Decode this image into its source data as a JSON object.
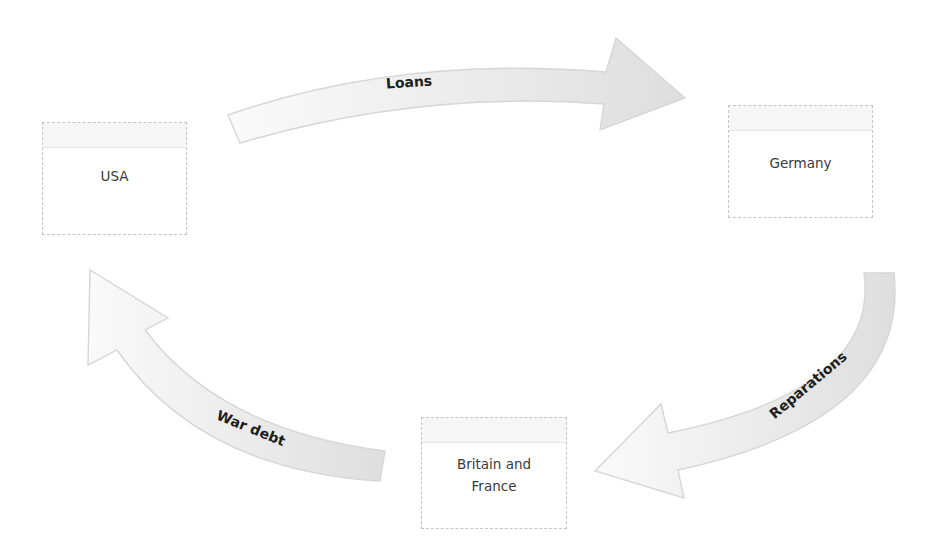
{
  "diagram": {
    "nodes": {
      "usa": {
        "label": "USA"
      },
      "germany": {
        "label": "Germany"
      },
      "britain_france": {
        "label_line1": "Britain and",
        "label_line2": "France"
      }
    },
    "flows": {
      "loans": {
        "label": "Loans",
        "from": "USA",
        "to": "Germany"
      },
      "reparations": {
        "label": "Reparations",
        "from": "Germany",
        "to": "Britain and France"
      },
      "war_debt": {
        "label": "War debt",
        "from": "Britain and France",
        "to": "USA"
      }
    },
    "colors": {
      "arrow_fill_light": "#f7f7f7",
      "arrow_fill_dark": "#dcdcdc",
      "arrow_outline": "#d6d6d6",
      "box_border": "#c4c4c4",
      "label_text": "#1e1e1e",
      "node_text": "#3a3a3a"
    }
  }
}
